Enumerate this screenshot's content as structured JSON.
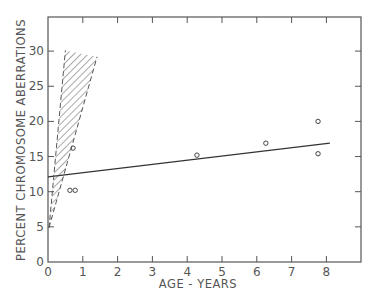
{
  "chart_data": {
    "type": "scatter",
    "title": "",
    "xlabel": "AGE - YEARS",
    "ylabel": "PERCENT CHROMOSOME ABERRATIONS",
    "xlim": [
      0,
      9
    ],
    "ylim": [
      0,
      33
    ],
    "grid": false,
    "legend": null,
    "x_ticks": [
      0,
      1,
      2,
      3,
      4,
      5,
      6,
      7,
      8
    ],
    "y_ticks": [
      0,
      5,
      10,
      15,
      20,
      25,
      30
    ],
    "series": [
      {
        "name": "observations",
        "kind": "scatter",
        "marker": "open-circle",
        "points": [
          {
            "x": 0.63,
            "y": 10.2
          },
          {
            "x": 0.78,
            "y": 10.2
          },
          {
            "x": 0.72,
            "y": 16.2
          },
          {
            "x": 4.28,
            "y": 15.2
          },
          {
            "x": 6.26,
            "y": 16.9
          },
          {
            "x": 7.76,
            "y": 20.0
          },
          {
            "x": 7.76,
            "y": 15.4
          }
        ]
      },
      {
        "name": "regression line",
        "kind": "line",
        "points": [
          {
            "x": 0.0,
            "y": 12.1
          },
          {
            "x": 8.1,
            "y": 16.9
          }
        ]
      },
      {
        "name": "hatched region",
        "kind": "area",
        "style": "diagonal-hatch, dashed edges",
        "polygon": [
          {
            "x": 0.03,
            "y": 4.9
          },
          {
            "x": 0.5,
            "y": 30.1
          },
          {
            "x": 1.41,
            "y": 29.2
          }
        ]
      }
    ]
  }
}
